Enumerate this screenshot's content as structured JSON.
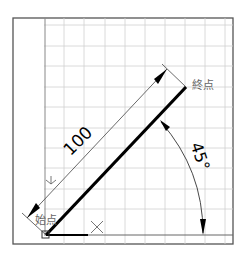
{
  "diagram": {
    "labels": {
      "start_point": "始点",
      "end_point": "終点",
      "length": "100",
      "angle": "45°",
      "y_axis": "Y",
      "x_axis": "X"
    },
    "colors": {
      "frame": "#555555",
      "grid": "#cfcfcf",
      "line": "#000000",
      "dimension": "#333333",
      "label_text": "#555555"
    },
    "line": {
      "length": 100,
      "angle_deg": 45
    }
  }
}
